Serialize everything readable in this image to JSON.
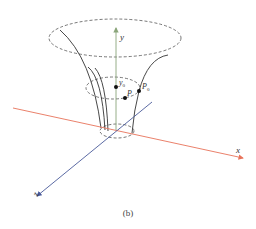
{
  "figure": {
    "caption": "(b)",
    "colors": {
      "x_axis": "#e8735a",
      "y_axis": "#8aa57a",
      "z_axis": "#4a5a9a",
      "curves": "#333333",
      "dashed": "#555555",
      "points": "#111111"
    },
    "axes": {
      "x": {
        "label": "x"
      },
      "y": {
        "label": "y"
      },
      "z": {
        "label": "z"
      }
    },
    "points": [
      {
        "id": "y0",
        "label": "y",
        "subscript": "0"
      },
      {
        "id": "P",
        "label": "P",
        "subscript": ""
      },
      {
        "id": "P0",
        "label": "P",
        "subscript": "0"
      }
    ],
    "ellipses": [
      "top-section",
      "middle-section",
      "bottom-section"
    ]
  }
}
